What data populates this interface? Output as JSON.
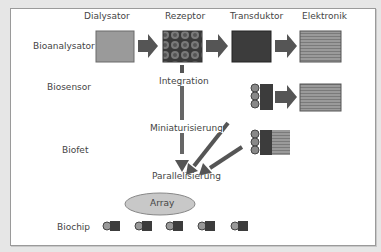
{
  "columns": [
    "Dialysator",
    "Rezeptor",
    "Transduktor",
    "Elektronik"
  ],
  "rows": [
    "Bioanalysator",
    "Biosensor",
    "Biofet",
    "Biochip"
  ],
  "steps": [
    "Integration",
    "Miniaturisierung",
    "Parallelisierung"
  ],
  "array_label": "Array",
  "colors": {
    "dialysator": "#9a9a9a",
    "rezeptor": "#4a4a4a",
    "transduktor": "#3c3c3c",
    "elektronik": "#8c8c8c",
    "arrow": "#555555",
    "array_fill": "#c8c8c8",
    "background": "#e6e6e6",
    "panel": "#ffffff"
  },
  "biochip_count": 5
}
